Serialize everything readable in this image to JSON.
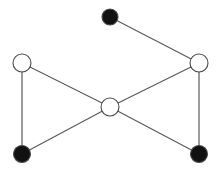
{
  "diagram": {
    "type": "graph",
    "width": 219,
    "height": 174,
    "colors": {
      "background": "#ffffff",
      "edge": "#5a5a5a",
      "node_stroke": "#4a4a4a",
      "filled": "#111111",
      "empty": "#ffffff"
    },
    "nodes": [
      {
        "id": "top",
        "x": 110,
        "y": 17,
        "r": 8,
        "filled": true
      },
      {
        "id": "left",
        "x": 22,
        "y": 63,
        "r": 9,
        "filled": false
      },
      {
        "id": "right",
        "x": 199,
        "y": 63,
        "r": 9,
        "filled": false
      },
      {
        "id": "center",
        "x": 110,
        "y": 107,
        "r": 9,
        "filled": false
      },
      {
        "id": "bottom-left",
        "x": 22,
        "y": 154,
        "r": 8.5,
        "filled": true
      },
      {
        "id": "bottom-right",
        "x": 199,
        "y": 154,
        "r": 8.5,
        "filled": true
      }
    ],
    "edges": [
      {
        "from": "top",
        "to": "right"
      },
      {
        "from": "left",
        "to": "center"
      },
      {
        "from": "right",
        "to": "center"
      },
      {
        "from": "left",
        "to": "bottom-left"
      },
      {
        "from": "right",
        "to": "bottom-right"
      },
      {
        "from": "center",
        "to": "bottom-left"
      },
      {
        "from": "center",
        "to": "bottom-right"
      }
    ]
  }
}
